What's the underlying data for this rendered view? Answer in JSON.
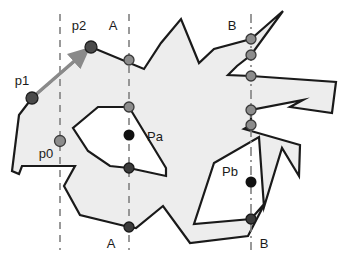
{
  "figure": {
    "background_color": "#ffffff",
    "polygon_fill": "#ededed",
    "polygon_stroke": "#1a1a1a",
    "vector_color": "#7f7f7f",
    "intersection_dot_color": "#858585",
    "vertex_dot_color": "#444444",
    "test_point_color": "#111111",
    "scanline_color": "#808080"
  },
  "labels": {
    "p2": "p2",
    "p1": "p1",
    "p0": "p0",
    "Pa": "Pa",
    "Pb": "Pb",
    "A_top": "A",
    "A_bottom": "A",
    "B_top": "B",
    "B_bottom": "B"
  },
  "scanlines": [
    {
      "name": "p0-p1-line",
      "style": "dashed",
      "x": 60,
      "y1": 14,
      "y2": 250
    },
    {
      "name": "line-A",
      "style": "dashed",
      "x": 129,
      "y1": 14,
      "y2": 250
    },
    {
      "name": "line-B",
      "style": "dash-dot",
      "x": 251,
      "y1": 14,
      "y2": 250
    }
  ],
  "points": {
    "p0": {
      "x": 60,
      "y": 141,
      "kind": "intersection"
    },
    "p1": {
      "x": 32,
      "y": 98,
      "kind": "vertex"
    },
    "p2": {
      "x": 91,
      "y": 47,
      "kind": "vertex"
    },
    "Pa": {
      "x": 129,
      "y": 135,
      "kind": "test-point"
    },
    "Pb": {
      "x": 251,
      "y": 182,
      "kind": "test-point"
    }
  },
  "intersections_A": [
    {
      "x": 129,
      "y": 60
    },
    {
      "x": 129,
      "y": 107
    },
    {
      "x": 129,
      "y": 168
    },
    {
      "x": 129,
      "y": 227
    }
  ],
  "intersections_B": [
    {
      "x": 251,
      "y": 39
    },
    {
      "x": 251,
      "y": 55
    },
    {
      "x": 251,
      "y": 76
    },
    {
      "x": 251,
      "y": 110
    },
    {
      "x": 251,
      "y": 125
    },
    {
      "x": 251,
      "y": 219
    }
  ],
  "vector": {
    "name": "p1-to-p2-arrow",
    "from": {
      "x": 32,
      "y": 98
    },
    "to": {
      "x": 91,
      "y": 47
    }
  },
  "polygon_outer": "32,98 91,47 129,60 144,69 180,33 196,63 213,51 251,39 283,11 251,55 240,63 228,73 251,76 336,82 332,111 273,107 290,102 251,110 251,125 245,128 295,146 298,172 281,146 267,203 261,137 214,164 196,224 251,219 264,203 251,236 193,243 163,206 136,228 129,227 80,215 65,187 74,166 22,166 19,174 12,171 19,115",
  "polygon_inner": "129,107 98,107 73,129 88,150 111,167 129,168 251,110 251,125"
}
